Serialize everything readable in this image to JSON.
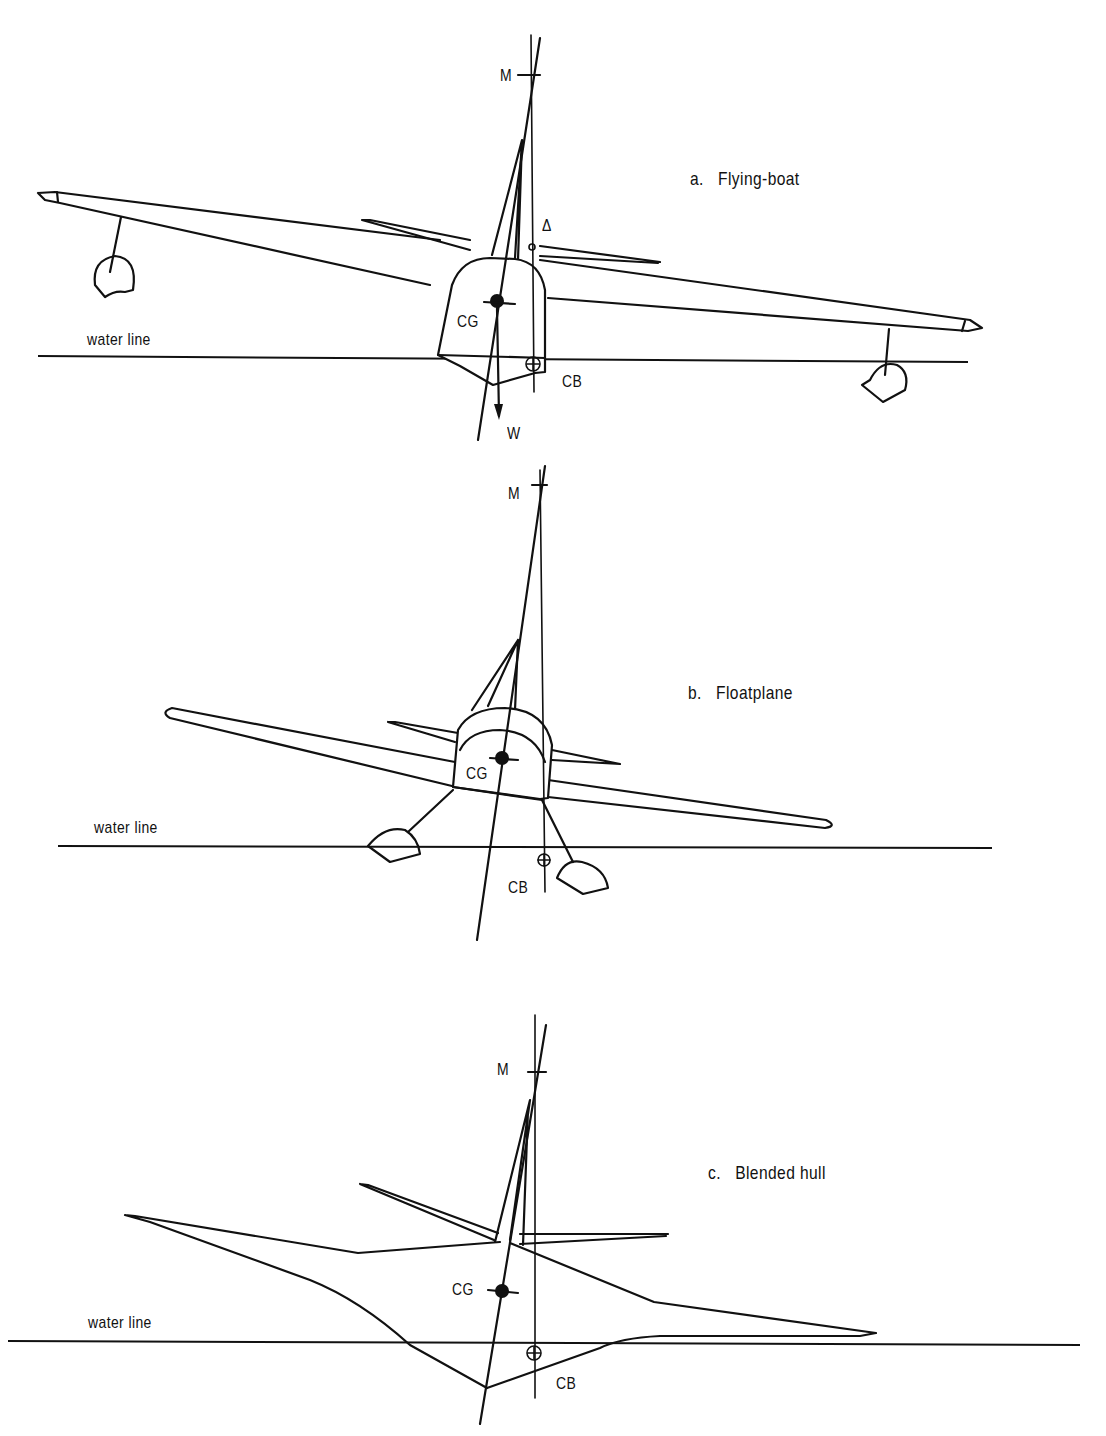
{
  "figure": {
    "panels": [
      {
        "id": "a",
        "caption": "a.   Flying-boat",
        "labels": {
          "metacenter": "M",
          "delta": "Δ",
          "cg": "CG",
          "cb": "CB",
          "weight": "W",
          "water_line": "water line"
        }
      },
      {
        "id": "b",
        "caption": "b.   Floatplane",
        "labels": {
          "metacenter": "M",
          "cg": "CG",
          "cb": "CB",
          "water_line": "water line"
        }
      },
      {
        "id": "c",
        "caption": "c.   Blended hull",
        "labels": {
          "metacenter": "M",
          "cg": "CG",
          "cb": "CB",
          "water_line": "water line"
        }
      }
    ],
    "colors": {
      "ink": "#111111",
      "paper": "#ffffff"
    }
  }
}
